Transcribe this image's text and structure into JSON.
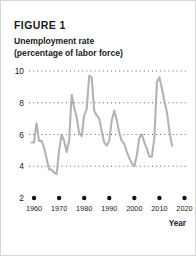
{
  "figure": {
    "label": "FIGURE 1",
    "subtitle_line1": "Unemployment rate",
    "subtitle_line2": "(percentage of labor force)",
    "axis_title_x": "Year"
  },
  "style": {
    "line_color": "#b3b3b3",
    "grid_color": "#4d4d4d",
    "text_color": "#1a1a1a",
    "background": "#ffffff",
    "border_color": "#d9d7d2"
  },
  "chart_data": {
    "type": "line",
    "title": "Unemployment rate (percentage of labor force)",
    "xlabel": "Year",
    "ylabel": "",
    "xlim": [
      1958,
      2021
    ],
    "ylim": [
      2,
      10
    ],
    "yticks": [
      10,
      8,
      6,
      4,
      2
    ],
    "xticks": [
      1960,
      1970,
      1980,
      1990,
      2000,
      2010,
      2020
    ],
    "grid": "horizontal-dotted",
    "legend": "none",
    "series": [
      {
        "name": "Unemployment rate",
        "x": [
          1959,
          1960,
          1961,
          1962,
          1963,
          1964,
          1965,
          1966,
          1967,
          1968,
          1969,
          1970,
          1971,
          1972,
          1973,
          1974,
          1975,
          1976,
          1977,
          1978,
          1979,
          1980,
          1981,
          1982,
          1983,
          1984,
          1985,
          1986,
          1987,
          1988,
          1989,
          1990,
          1991,
          1992,
          1993,
          1994,
          1995,
          1996,
          1997,
          1998,
          1999,
          2000,
          2001,
          2002,
          2003,
          2004,
          2005,
          2006,
          2007,
          2008,
          2009,
          2010,
          2011,
          2012,
          2013,
          2014,
          2015
        ],
        "values": [
          5.5,
          5.5,
          6.7,
          5.6,
          5.6,
          5.2,
          4.5,
          3.8,
          3.8,
          3.6,
          3.5,
          5.0,
          6.0,
          5.6,
          4.9,
          5.6,
          8.5,
          7.7,
          7.1,
          6.1,
          5.9,
          7.2,
          7.6,
          9.7,
          9.6,
          7.5,
          7.2,
          7.0,
          6.2,
          5.5,
          5.3,
          5.6,
          6.9,
          7.5,
          6.9,
          6.1,
          5.6,
          5.4,
          4.9,
          4.5,
          4.2,
          4.0,
          4.7,
          5.8,
          6.0,
          5.5,
          5.1,
          4.6,
          4.6,
          5.8,
          9.3,
          9.6,
          8.9,
          8.1,
          7.4,
          6.2,
          5.3
        ]
      }
    ]
  }
}
